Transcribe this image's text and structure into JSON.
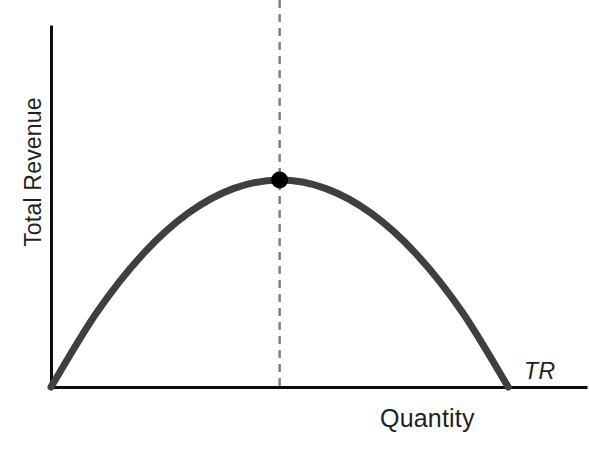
{
  "chart_data": {
    "type": "line",
    "title": "",
    "subtitle": "",
    "xlabel": "Quantity",
    "ylabel": "Total Revenue",
    "grid": false,
    "legend_position": "inline-right-end",
    "series": [
      {
        "name": "TR",
        "label": "TR",
        "description": "Total revenue as an inverted-U (concave) parabola of quantity, starting at the origin, peaking at the marked maximum, and falling back to zero.",
        "color": "#3f3f3f",
        "x": [
          0,
          10,
          20,
          30,
          40,
          50,
          60,
          70,
          80,
          90,
          100
        ],
        "values": [
          0,
          36,
          64,
          84,
          96,
          100,
          96,
          84,
          64,
          36,
          0
        ]
      }
    ],
    "annotations": [
      {
        "name": "revenue-maximizing-point",
        "label": "",
        "marker": "filled-circle",
        "x": 50,
        "y": 100,
        "color": "#000000"
      },
      {
        "name": "revenue-maximizing-quantity-guide",
        "label": "",
        "style": "dashed-vertical",
        "x": 50,
        "color": "#808080"
      }
    ],
    "xlim": [
      0,
      117
    ],
    "ylim": [
      0,
      174
    ],
    "x_ticks": [],
    "y_ticks": [],
    "x_tick_labels": [],
    "y_tick_labels": []
  },
  "axes": {
    "y_axis_label": "Total Revenue",
    "x_axis_label": "Quantity",
    "axis_color": "#000000"
  },
  "series_label": {
    "text": "TR"
  },
  "colors": {
    "curve": "#3f3f3f",
    "axis": "#0d0d0d",
    "dashed_guide": "#808080",
    "marker": "#000000",
    "background": "#ffffff",
    "text": "#231f20"
  }
}
